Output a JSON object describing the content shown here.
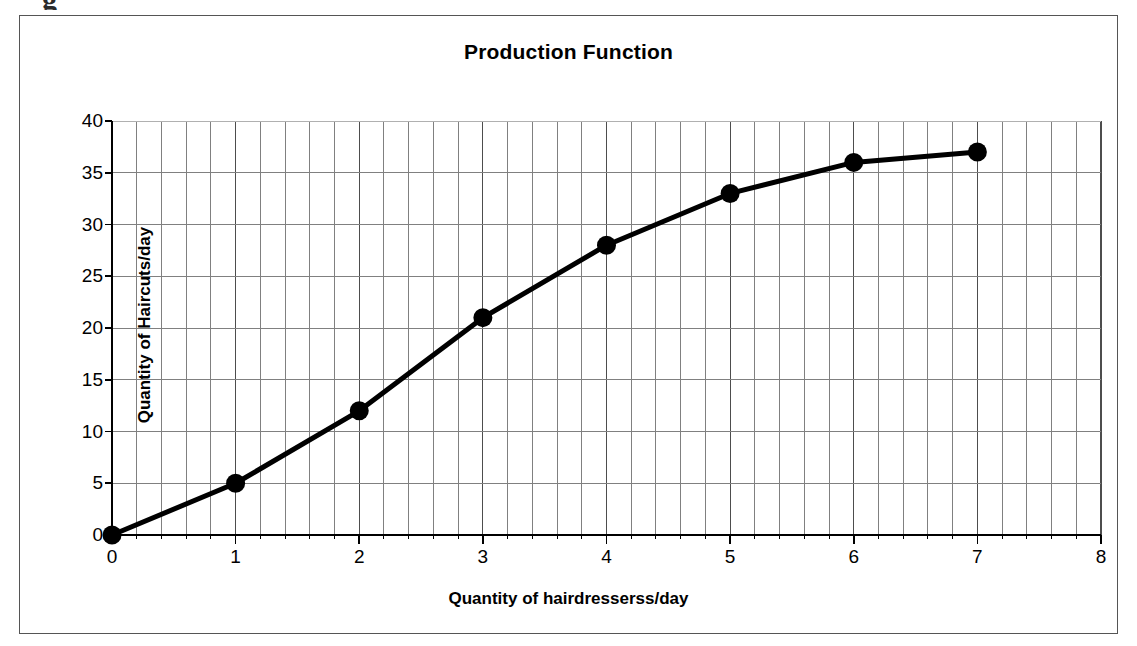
{
  "chart_data": {
    "type": "line",
    "title": "Production Function",
    "xlabel": "Quantity of hairdresserss/day",
    "ylabel": "Quantity of Haircuts/day",
    "x": [
      0,
      1,
      2,
      3,
      4,
      5,
      6,
      7
    ],
    "values": [
      0,
      5,
      12,
      21,
      28,
      33,
      36,
      37
    ],
    "series": [
      {
        "name": "Production Function",
        "x": [
          0,
          1,
          2,
          3,
          4,
          5,
          6,
          7
        ],
        "values": [
          0,
          5,
          12,
          21,
          28,
          33,
          36,
          37
        ]
      }
    ],
    "xlim": [
      0,
      8
    ],
    "ylim": [
      0,
      40
    ],
    "xticks": [
      "0",
      "1",
      "2",
      "3",
      "4",
      "5",
      "6",
      "7",
      "8"
    ],
    "yticks": [
      "0",
      "5",
      "10",
      "15",
      "20",
      "25",
      "30",
      "35",
      "40"
    ],
    "x_major_step": 1,
    "x_minor_step": 0.2,
    "y_major_step": 5,
    "grid": {
      "vertical_minor": true,
      "vertical_major": true,
      "horizontal_major": true,
      "horizontal_minor": false
    },
    "legend": "none",
    "marker": "filled-circle",
    "line_color": "#000000",
    "marker_color": "#000000",
    "grid_color": "#808080",
    "axis_color": "#000000",
    "frame_color": "#555555",
    "background": "#ffffff"
  },
  "stray": {
    "glyph": "g"
  }
}
